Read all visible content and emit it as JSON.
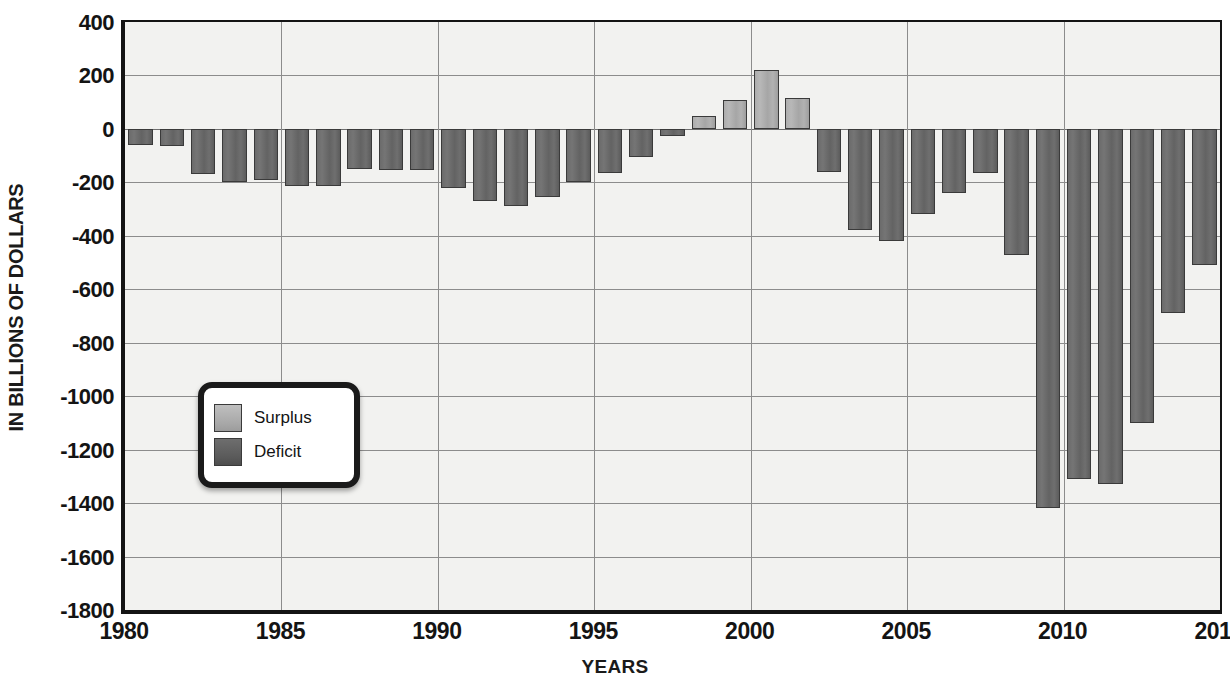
{
  "chart_data": {
    "type": "bar",
    "title": "",
    "xlabel": "YEARS",
    "ylabel": "IN BILLIONS OF DOLLARS",
    "ylim": [
      -1800,
      400
    ],
    "xlim": [
      1980,
      2015
    ],
    "ytick_labels": [
      "400",
      "200",
      "0",
      "-200",
      "-400",
      "-600",
      "-800",
      "-1000",
      "-1200",
      "-1400",
      "-1600",
      "-1800"
    ],
    "ytick_values": [
      400,
      200,
      0,
      -200,
      -400,
      -600,
      -800,
      -1000,
      -1200,
      -1400,
      -1600,
      -1800
    ],
    "xtick_labels": [
      "1980",
      "1985",
      "1990",
      "1995",
      "2000",
      "2005",
      "2010",
      "2015"
    ],
    "xtick_values": [
      1980,
      1985,
      1990,
      1995,
      2000,
      2005,
      2010,
      2015
    ],
    "grid": true,
    "legend": {
      "position": "inside-lower-left",
      "entries": [
        {
          "name": "Surplus",
          "color": "#adadad"
        },
        {
          "name": "Deficit",
          "color": "#6b6b6b"
        }
      ]
    },
    "categories": [
      1980,
      1981,
      1982,
      1983,
      1984,
      1985,
      1986,
      1987,
      1988,
      1989,
      1990,
      1991,
      1992,
      1993,
      1994,
      1995,
      1996,
      1997,
      1998,
      1999,
      2000,
      2001,
      2002,
      2003,
      2004,
      2005,
      2006,
      2007,
      2008,
      2009,
      2010,
      2011,
      2012,
      2013,
      2014
    ],
    "values": [
      -60,
      -65,
      -170,
      -200,
      -190,
      -215,
      -215,
      -150,
      -155,
      -155,
      -220,
      -270,
      -290,
      -255,
      -200,
      -165,
      -105,
      -25,
      50,
      110,
      220,
      115,
      -160,
      -380,
      -420,
      -320,
      -240,
      -165,
      -470,
      -1420,
      -1310,
      -1330,
      -1100,
      -690,
      -510
    ],
    "colors": [
      "deficit",
      "deficit",
      "deficit",
      "deficit",
      "deficit",
      "deficit",
      "deficit",
      "deficit",
      "deficit",
      "deficit",
      "deficit",
      "deficit",
      "deficit",
      "deficit",
      "deficit",
      "deficit",
      "deficit",
      "deficit",
      "surplus",
      "surplus",
      "surplus",
      "surplus",
      "deficit",
      "deficit",
      "deficit",
      "deficit",
      "deficit",
      "deficit",
      "deficit",
      "deficit",
      "deficit",
      "deficit",
      "deficit",
      "deficit",
      "deficit"
    ]
  },
  "axis": {
    "y_title": "IN BILLIONS OF DOLLARS",
    "x_title": "YEARS"
  },
  "legend": {
    "surplus_label": "Surplus",
    "deficit_label": "Deficit"
  }
}
